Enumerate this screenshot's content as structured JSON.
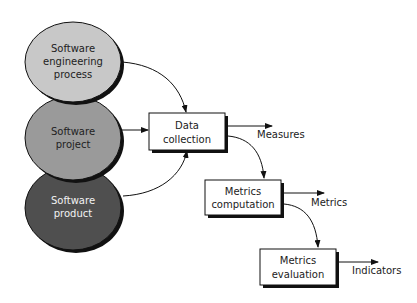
{
  "sources": [
    {
      "lines": [
        "Software",
        "engineering",
        "process"
      ],
      "fill": "#c8c8c8",
      "text_color": "#222222"
    },
    {
      "lines": [
        "Software",
        "project"
      ],
      "fill": "#9a9a9a",
      "text_color": "#222222"
    },
    {
      "lines": [
        "Software",
        "product"
      ],
      "fill": "#4f4f4f",
      "text_color": "#f2f2f2"
    }
  ],
  "steps": [
    {
      "lines": [
        "Data",
        "collection"
      ],
      "output": "Measures"
    },
    {
      "lines": [
        "Metrics",
        "computation"
      ],
      "output": "Metrics"
    },
    {
      "lines": [
        "Metrics",
        "evaluation"
      ],
      "output": "Indicators"
    }
  ],
  "colors": {
    "stroke": "#111111",
    "shadow": "#111111",
    "box_fill": "#ffffff"
  }
}
